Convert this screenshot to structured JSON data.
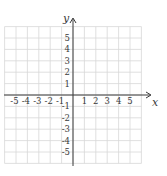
{
  "diagram": {
    "type": "cartesian-coordinate-plane",
    "x_axis": {
      "label": "x",
      "ticks": [
        "-5",
        "-4",
        "-3",
        "-2",
        "-1",
        "1",
        "2",
        "3",
        "4",
        "5"
      ],
      "range": [
        -6,
        6
      ]
    },
    "y_axis": {
      "label": "y",
      "ticks": [
        "5",
        "4",
        "3",
        "2",
        "1",
        "-1",
        "-2",
        "-3",
        "-4",
        "-5"
      ],
      "range": [
        -6,
        6
      ]
    },
    "grid": {
      "columns": 12,
      "rows": 12,
      "visible": true
    },
    "colors": {
      "grid": "#d8d8d8",
      "axis": "#3a3a3a",
      "text": "#3a3a3a"
    }
  }
}
